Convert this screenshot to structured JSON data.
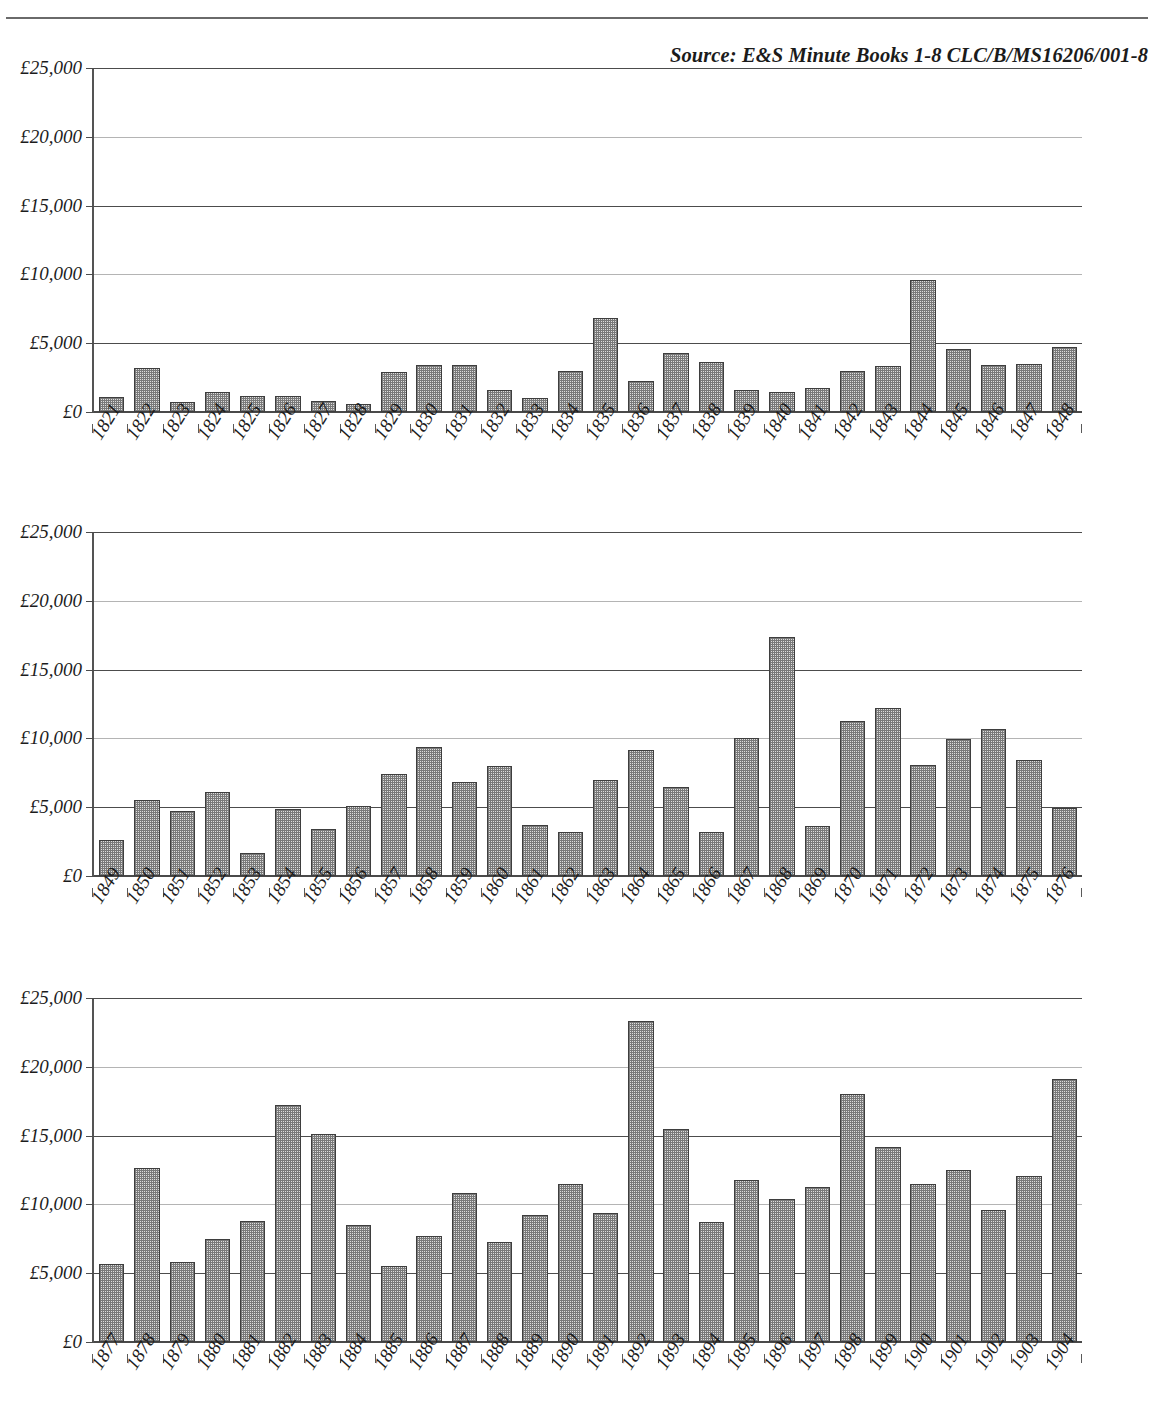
{
  "document": {
    "source_note": "Source: E&S Minute Books  1-8 CLC/B/MS16206/001-8"
  },
  "chart_data": [
    {
      "id": "chart-1",
      "type": "bar",
      "title": "",
      "xlabel": "",
      "ylabel": "",
      "ylim": [
        0,
        25000
      ],
      "yticks": [
        0,
        5000,
        10000,
        15000,
        20000,
        25000
      ],
      "ytick_labels": [
        "£0",
        "£5,000",
        "£10,000",
        "£15,000",
        "£20,000",
        "£25,000"
      ],
      "grid": true,
      "legend": "none",
      "categories": [
        "1821",
        "1822",
        "1823",
        "1824",
        "1825",
        "1826",
        "1827",
        "1828",
        "1829",
        "1830",
        "1831",
        "1832",
        "1833",
        "1834",
        "1835",
        "1836",
        "1837",
        "1838",
        "1839",
        "1840",
        "1841",
        "1842",
        "1843",
        "1844",
        "1845",
        "1846",
        "1847",
        "1848"
      ],
      "values": [
        1100,
        3200,
        700,
        1450,
        1200,
        1150,
        800,
        550,
        2900,
        3400,
        3400,
        1600,
        1000,
        3000,
        6800,
        2250,
        4300,
        3650,
        1600,
        1450,
        1750,
        2950,
        3350,
        9600,
        4600,
        3450,
        3500,
        4700
      ]
    },
    {
      "id": "chart-2",
      "type": "bar",
      "title": "",
      "xlabel": "",
      "ylabel": "",
      "ylim": [
        0,
        25000
      ],
      "yticks": [
        0,
        5000,
        10000,
        15000,
        20000,
        25000
      ],
      "ytick_labels": [
        "£0",
        "£5,000",
        "£10,000",
        "£15,000",
        "£20,000",
        "£25,000"
      ],
      "grid": true,
      "legend": "none",
      "categories": [
        "1849",
        "1850",
        "1851",
        "1852",
        "1853",
        "1854",
        "1855",
        "1856",
        "1857",
        "1858",
        "1859",
        "1860",
        "1861",
        "1862",
        "1863",
        "1864",
        "1865",
        "1866",
        "1867",
        "1868",
        "1869",
        "1870",
        "1871",
        "1872",
        "1873",
        "1874",
        "1875",
        "1876"
      ],
      "values": [
        2650,
        5500,
        4700,
        6100,
        1700,
        4850,
        3450,
        5100,
        7400,
        9400,
        6800,
        8000,
        3700,
        3200,
        7000,
        9150,
        6500,
        3200,
        10000,
        17400,
        3600,
        11300,
        12200,
        8100,
        9950,
        10650,
        8450,
        4950
      ]
    },
    {
      "id": "chart-3",
      "type": "bar",
      "title": "",
      "xlabel": "",
      "ylabel": "",
      "ylim": [
        0,
        25000
      ],
      "yticks": [
        0,
        5000,
        10000,
        15000,
        20000,
        25000
      ],
      "ytick_labels": [
        "£0",
        "£5,000",
        "£10,000",
        "£15,000",
        "£20,000",
        "£25,000"
      ],
      "grid": true,
      "legend": "none",
      "categories": [
        "1877",
        "1878",
        "1879",
        "1880",
        "1881",
        "1882",
        "1883",
        "1884",
        "1885",
        "1886",
        "1887",
        "1888",
        "1889",
        "1890",
        "1891",
        "1892",
        "1893",
        "1894",
        "1895",
        "1896",
        "1897",
        "1898",
        "1899",
        "1900",
        "1901",
        "1902",
        "1903",
        "1904"
      ],
      "values": [
        5700,
        12650,
        5800,
        7500,
        8800,
        17200,
        15100,
        8500,
        5500,
        7700,
        10800,
        7300,
        9200,
        11500,
        9350,
        23300,
        15500,
        8700,
        11800,
        10400,
        11250,
        18000,
        14200,
        11450,
        12500,
        9600,
        12050,
        19100
      ]
    }
  ]
}
